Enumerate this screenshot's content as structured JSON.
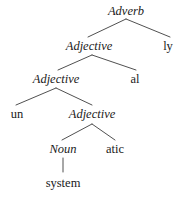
{
  "figure": {
    "type": "syntactic-derivation-tree",
    "background_color": "#ffffff",
    "text_color": "#1a1a1a",
    "edge_color": "#3c3c3c"
  },
  "nodes": [
    {
      "id": "n0",
      "label": "Adverb",
      "style": "category",
      "x": 126,
      "y": 5,
      "level": 0
    },
    {
      "id": "n1",
      "label": "Adjective",
      "style": "category",
      "x": 89,
      "y": 40,
      "level": 1
    },
    {
      "id": "n2",
      "label": "ly",
      "style": "morpheme",
      "x": 168,
      "y": 40,
      "level": 1
    },
    {
      "id": "n3",
      "label": "Adjective",
      "style": "category",
      "x": 56,
      "y": 73,
      "level": 2
    },
    {
      "id": "n4",
      "label": "al",
      "style": "morpheme",
      "x": 135,
      "y": 73,
      "level": 2
    },
    {
      "id": "n5",
      "label": "un",
      "style": "morpheme",
      "x": 17,
      "y": 108,
      "level": 3
    },
    {
      "id": "n6",
      "label": "Adjective",
      "style": "category",
      "x": 92,
      "y": 108,
      "level": 3
    },
    {
      "id": "n7",
      "label": "Noun",
      "style": "category",
      "x": 63,
      "y": 143,
      "level": 4
    },
    {
      "id": "n8",
      "label": "atic",
      "style": "morpheme",
      "x": 115,
      "y": 143,
      "level": 4
    },
    {
      "id": "n9",
      "label": "system",
      "style": "morpheme",
      "x": 63,
      "y": 177,
      "level": 5
    }
  ],
  "edges": [
    {
      "from": "n0",
      "to": "n1",
      "x1": 126,
      "y1": 19,
      "x2": 88,
      "y2": 37
    },
    {
      "from": "n0",
      "to": "n2",
      "x1": 126,
      "y1": 19,
      "x2": 170,
      "y2": 37
    },
    {
      "from": "n1",
      "to": "n3",
      "x1": 92,
      "y1": 55,
      "x2": 58,
      "y2": 70
    },
    {
      "from": "n1",
      "to": "n4",
      "x1": 92,
      "y1": 55,
      "x2": 136,
      "y2": 70
    },
    {
      "from": "n3",
      "to": "n5",
      "x1": 56,
      "y1": 88,
      "x2": 16,
      "y2": 105
    },
    {
      "from": "n3",
      "to": "n6",
      "x1": 56,
      "y1": 88,
      "x2": 92,
      "y2": 105
    },
    {
      "from": "n6",
      "to": "n7",
      "x1": 92,
      "y1": 124,
      "x2": 62,
      "y2": 140
    },
    {
      "from": "n6",
      "to": "n8",
      "x1": 92,
      "y1": 124,
      "x2": 115,
      "y2": 140
    },
    {
      "from": "n7",
      "to": "n9",
      "x1": 63,
      "y1": 158,
      "x2": 63,
      "y2": 172
    }
  ]
}
